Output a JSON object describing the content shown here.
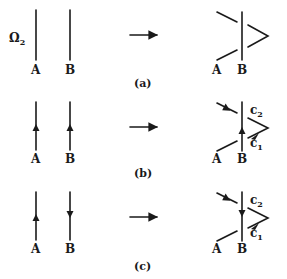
{
  "figure": {
    "panels": [
      {
        "id": "a",
        "caption": "(a)",
        "left_label": "Ω",
        "left_label_sub": "2",
        "line_a_label": "A",
        "line_b_label": "B",
        "line_a_direction": "none",
        "line_b_direction": "none",
        "result_a_label": "A",
        "result_b_label": "B",
        "result_c1_label": "",
        "result_c2_label": ""
      },
      {
        "id": "b",
        "caption": "(b)",
        "line_a_label": "A",
        "line_b_label": "B",
        "line_a_direction": "up",
        "line_b_direction": "up",
        "result_a_label": "A",
        "result_b_label": "B",
        "result_c1_label": "c",
        "result_c1_sub": "1",
        "result_c2_label": "c",
        "result_c2_sub": "2",
        "result_b_direction": "up"
      },
      {
        "id": "c",
        "caption": "(c)",
        "line_a_label": "A",
        "line_b_label": "B",
        "line_a_direction": "up",
        "line_b_direction": "down",
        "result_a_label": "A",
        "result_b_label": "B",
        "result_c1_label": "c",
        "result_c1_sub": "1",
        "result_c2_label": "c",
        "result_c2_sub": "2",
        "result_b_direction": "down"
      }
    ],
    "transform_arrow": "→"
  }
}
